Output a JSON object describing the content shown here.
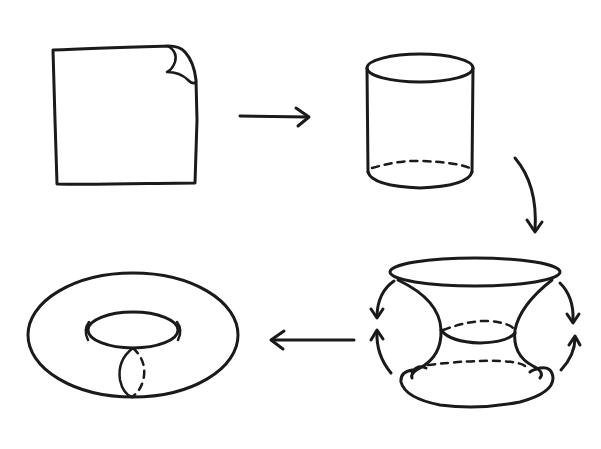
{
  "diagram": {
    "title": "Constructing a torus from a square sheet",
    "stages": [
      {
        "id": "square",
        "label": "Flat square sheet with a curled corner"
      },
      {
        "id": "cylinder",
        "label": "Sheet rolled into a cylinder"
      },
      {
        "id": "bent-cylinder",
        "label": "Cylinder ends bent toward each other"
      },
      {
        "id": "torus",
        "label": "Ends glued to form a torus"
      }
    ],
    "arrows": [
      {
        "id": "square-to-cylinder",
        "direction": "right"
      },
      {
        "id": "cylinder-to-bent",
        "direction": "down-curved"
      },
      {
        "id": "bent-to-torus",
        "direction": "left"
      }
    ],
    "colors": {
      "ink": "#1a1a1a",
      "background": "#ffffff"
    }
  }
}
